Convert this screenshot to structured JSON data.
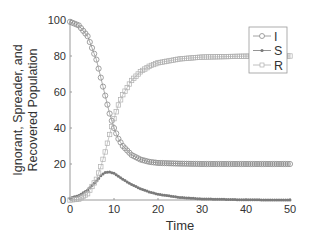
{
  "chart_data": {
    "type": "line",
    "title": "",
    "xlabel": "Time",
    "ylabel": "Ignorant, Spreader, and Recovered Population",
    "ylabel_lines": [
      "Ignorant, Spreader, and",
      "Recovered Population"
    ],
    "xlim": [
      0,
      50
    ],
    "ylim": [
      0,
      100
    ],
    "xticks": [
      0,
      10,
      20,
      30,
      40,
      50
    ],
    "yticks": [
      0,
      20,
      40,
      60,
      80,
      100
    ],
    "grid": false,
    "legend_position": "upper right (inside)",
    "markers_every": 0.5,
    "series": [
      {
        "name": "I",
        "marker": "circle-open",
        "color": "#8a8a8a",
        "x": [
          0,
          2,
          4,
          6,
          7,
          8,
          9,
          10,
          11,
          12,
          14,
          16,
          18,
          20,
          25,
          30,
          40,
          50
        ],
        "values": [
          99,
          97,
          91,
          78,
          68,
          58,
          48,
          40,
          34,
          30,
          25,
          22.5,
          21.2,
          20.6,
          20.2,
          20,
          20,
          20
        ]
      },
      {
        "name": "S",
        "marker": "dot",
        "color": "#7a7a7a",
        "x": [
          0,
          2,
          4,
          6,
          7,
          8,
          9,
          10,
          11,
          12,
          14,
          16,
          18,
          20,
          25,
          30,
          40,
          50
        ],
        "values": [
          1,
          2.5,
          5.5,
          10.5,
          13.5,
          15.3,
          15.6,
          14.8,
          13.2,
          11.5,
          8.6,
          6.3,
          4.5,
          3.2,
          1.4,
          0.6,
          0.1,
          0
        ]
      },
      {
        "name": "R",
        "marker": "square-open",
        "color": "#b0b0b0",
        "x": [
          0,
          2,
          4,
          6,
          7,
          8,
          9,
          10,
          11,
          12,
          14,
          16,
          18,
          20,
          25,
          30,
          40,
          50
        ],
        "values": [
          0,
          0.5,
          3.5,
          11.5,
          18.5,
          26.7,
          36.4,
          45.2,
          52.8,
          58.5,
          66.4,
          71.2,
          74.3,
          76.2,
          78.4,
          79.4,
          79.9,
          80
        ]
      }
    ]
  }
}
